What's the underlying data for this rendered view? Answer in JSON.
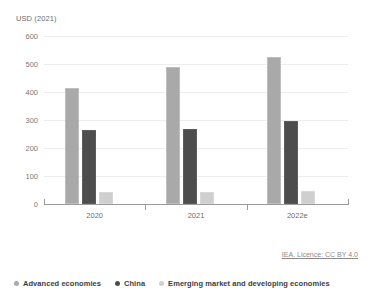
{
  "chart_data": {
    "type": "bar",
    "title": "",
    "subtitle": "",
    "xlabel": "",
    "ylabel": "USD (2021)",
    "categories": [
      "2020",
      "2021",
      "2022e"
    ],
    "series": [
      {
        "name": "Advanced economies",
        "color": "#a9a9a9",
        "values": [
          415,
          490,
          525
        ]
      },
      {
        "name": "China",
        "color": "#4d4d4d",
        "values": [
          265,
          268,
          297
        ]
      },
      {
        "name": "Emerging market and developing economies",
        "color": "#cfcfcf",
        "values": [
          42,
          43,
          45
        ]
      }
    ],
    "ylim": [
      0,
      600
    ],
    "yticks": [
      0,
      100,
      200,
      300,
      400,
      500,
      600
    ],
    "ytick_labels": [
      "0",
      "100",
      "200",
      "300",
      "400",
      "500",
      "600"
    ],
    "grid": true,
    "legend_position": "bottom-left",
    "annotations": {
      "credit": "IEA. Licence: CC BY 4.0"
    }
  }
}
